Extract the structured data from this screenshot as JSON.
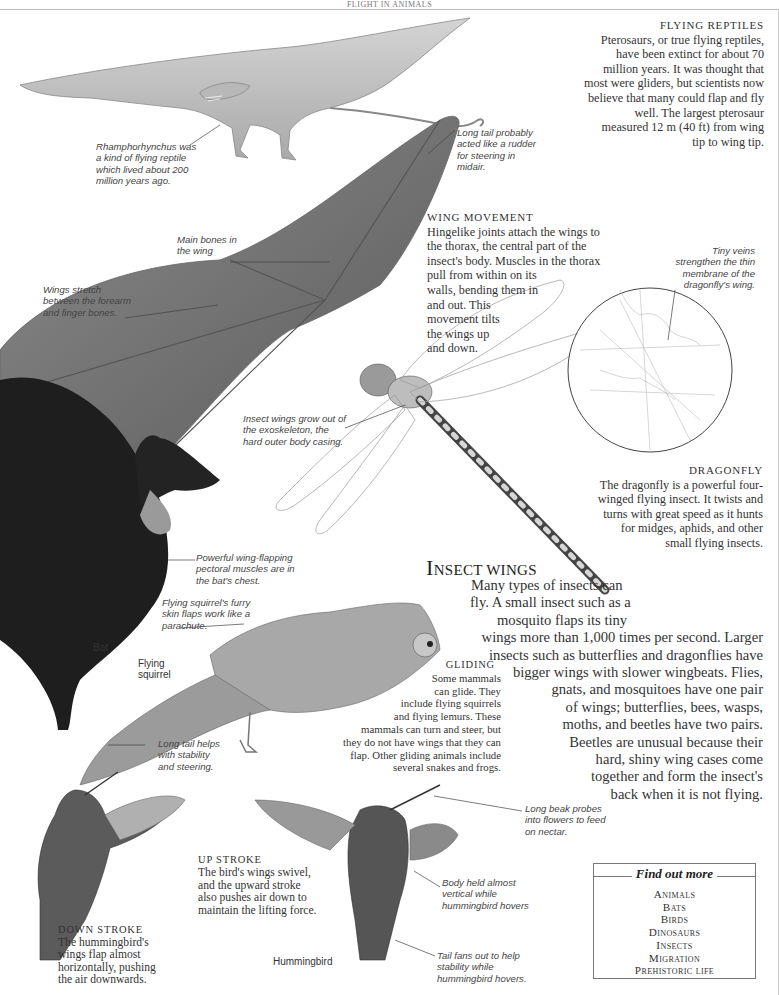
{
  "page": {
    "running_head": "FLIGHT IN ANIMALS"
  },
  "flying_reptiles": {
    "heading": "FLYING REPTILES",
    "lines": [
      "Pterosaurs, or true flying reptiles,",
      "have been extinct for about 70",
      "million years. It was thought that",
      "most were gliders, but scientists now",
      "believe that many could flap and fly",
      "well. The largest pterosaur",
      "measured 12 m (40 ft) from wing",
      "tip to wing tip."
    ]
  },
  "captions": {
    "rhamphorhynchus": [
      "Rhamphorhynchus was",
      "a kind of flying reptile",
      "which lived about 200",
      "million years ago."
    ],
    "long_tail_rudder": [
      "Long tail probably",
      "acted like a rudder",
      "for steering in",
      "midair."
    ],
    "main_bones": [
      "Main bones in",
      "the wing"
    ],
    "wings_stretch": [
      "Wings stretch",
      "between the forearm",
      "and finger bones."
    ],
    "tiny_veins": [
      "Tiny veins",
      "strengthen the thin",
      "membrane of the",
      "dragonfly's wing."
    ],
    "insect_wings_grow": [
      "Insect wings grow out of",
      "the exoskeleton, the",
      "hard outer body casing."
    ],
    "pectoral_muscles": [
      "Powerful wing-flapping",
      "pectoral muscles are in",
      "the bat's chest."
    ],
    "squirrel_skin": [
      "Flying squirrel's furry",
      "skin flaps work like a",
      "parachute."
    ],
    "long_tail_stability": [
      "Long tail helps",
      "with stability",
      "and steering."
    ],
    "long_beak": [
      "Long beak probes",
      "into flowers to feed",
      "on nectar."
    ],
    "body_held": [
      "Body held almost",
      "vertical while",
      "hummingbird hovers"
    ],
    "tail_fans": [
      "Tail fans out to help",
      "stability while",
      "hummingbird hovers."
    ]
  },
  "labels": {
    "bat": "Bat",
    "flying_squirrel": [
      "Flying",
      "squirrel"
    ],
    "hummingbird": "Hummingbird"
  },
  "wing_movement": {
    "heading": "WING MOVEMENT",
    "lines": [
      "Hingelike joints attach the wings to",
      "the thorax, the central part of the",
      "insect's body. Muscles in the thorax",
      "pull from within on its",
      "walls, bending them in",
      "and out. This",
      "movement tilts",
      "the wings up",
      "and down."
    ]
  },
  "dragonfly": {
    "heading": "DRAGONFLY",
    "lines": [
      "The dragonfly is a powerful four-",
      "winged flying insect. It twists and",
      "turns with great speed as it hunts",
      "for midges, aphids, and other",
      "small flying insects."
    ]
  },
  "insect_wings": {
    "title_initial": "I",
    "title_rest": "NSECT WINGS",
    "lines": [
      "Many types of insects can",
      "fly. A small insect such as a",
      "mosquito flaps its tiny",
      "wings more than 1,000 times per second. Larger",
      "insects such as butterflies and dragonflies have",
      "bigger wings with slower wingbeats. Flies,",
      "gnats, and mosquitoes have one pair",
      "of wings; butterflies, bees, wasps,",
      "moths, and beetles have two pairs.",
      "Beetles are unusual because their",
      "hard, shiny wing cases come",
      "together and form the insect's",
      "back when it is not flying."
    ]
  },
  "gliding": {
    "heading": "GLIDING",
    "lines": [
      "Some mammals",
      "can glide. They",
      "include flying squirrels",
      "and flying lemurs. These",
      "mammals can turn and steer, but",
      "they do not have wings that they can",
      "flap. Other gliding animals include",
      "several snakes and frogs."
    ]
  },
  "up_stroke": {
    "heading": "UP STROKE",
    "lines": [
      "The bird's wings swivel,",
      "and the upward stroke",
      "also pushes air down to",
      "maintain the lifting force."
    ]
  },
  "down_stroke": {
    "heading": "DOWN STROKE",
    "lines": [
      "The hummingbird's",
      "wings flap almost",
      "horizontally, pushing",
      "the air downwards."
    ]
  },
  "find_out_more": {
    "title": "Find out more",
    "items": [
      "Animals",
      "Bats",
      "Birds",
      "Dinosaurs",
      "Insects",
      "Migration",
      "Prehistoric life"
    ]
  }
}
